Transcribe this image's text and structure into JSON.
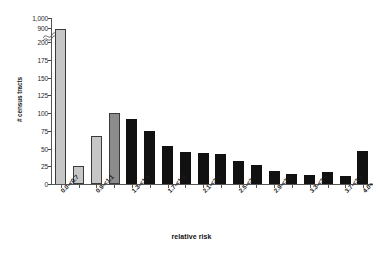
{
  "chart_data": {
    "type": "bar",
    "title": "",
    "xlabel": "relative risk",
    "ylabel": "# census tracts",
    "ylim": [
      0,
      200
    ],
    "y_break": {
      "present": true,
      "break_above": 200,
      "upper_ticks": [
        900,
        1000
      ]
    },
    "grid": false,
    "legend": "none",
    "y_ticks": [
      "0",
      "25",
      "50",
      "75",
      "100",
      "125",
      "150",
      "175",
      "200",
      "900",
      "1,000"
    ],
    "categories": [
      "0.0-<0.7",
      "0.7-<0.9",
      "0.9-<1.1",
      "1.1-<1.3",
      "1.3-<1.5",
      "1.5-<1.7",
      "1.7-<1.9",
      "1.9-<2.1",
      "2.1-<2.3",
      "2.3-<2.5",
      "2.5-<2.7",
      "2.7-<2.9",
      "2.9-<3.1",
      "3.1-<3.3",
      "3.3-<3.5",
      "3.5-<3.7",
      "3.7-<3.9",
      "4.0+"
    ],
    "visible_tick_labels": [
      "0.0-<0.7",
      "0.9-<1.1",
      "1.3-<1.5",
      "1.7-<1.9",
      "2.1-<2.3",
      "2.5-<2.7",
      "2.9-<3.1",
      "3.3-<3.5",
      "3.7-<3.9",
      "4.0+"
    ],
    "values": [
      950,
      25,
      68,
      100,
      92,
      75,
      54,
      45,
      44,
      42,
      33,
      27,
      18,
      14,
      13,
      17,
      11,
      47
    ],
    "bar_shades": [
      "light",
      "light",
      "light",
      "mid",
      "dark",
      "dark",
      "dark",
      "dark",
      "dark",
      "dark",
      "dark",
      "dark",
      "dark",
      "dark",
      "dark",
      "dark",
      "dark",
      "dark"
    ],
    "colors": {
      "light": "#c6c6c6",
      "mid": "#8c8c8c",
      "dark": "#111111",
      "axis": "#555555",
      "text": "#1a1a1a"
    }
  }
}
